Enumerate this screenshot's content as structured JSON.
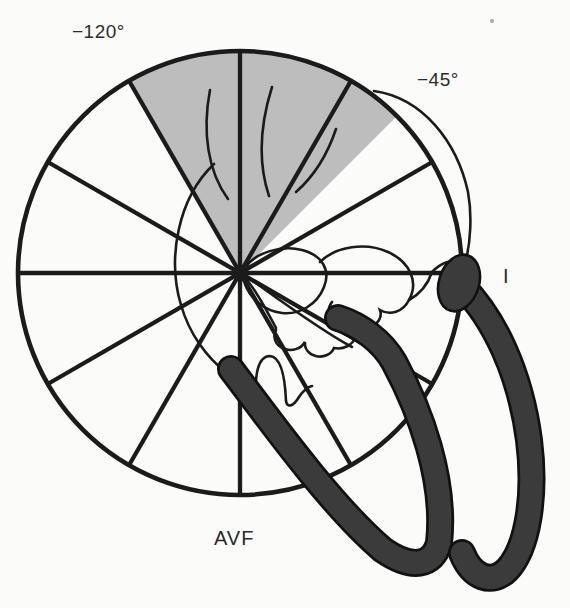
{
  "figure": {
    "labels": {
      "upper_left_angle": "−120°",
      "upper_right_angle": "−45°",
      "lead_i": "I",
      "lead_avf": "AVF"
    },
    "geometry": {
      "center_x": 240,
      "center_y": 273,
      "radius": 222,
      "spoke_interval_deg": 30,
      "shaded_sector_start_deg": -120,
      "shaded_sector_end_deg": -45
    },
    "colors": {
      "background": "#fbfbf9",
      "line": "#1b1b1b",
      "shaded_sector": "#bdbdbd",
      "dark_band_fill": "#3b3b3b",
      "dark_band_edge": "#111111",
      "label_text": "#2b2b2b"
    }
  }
}
